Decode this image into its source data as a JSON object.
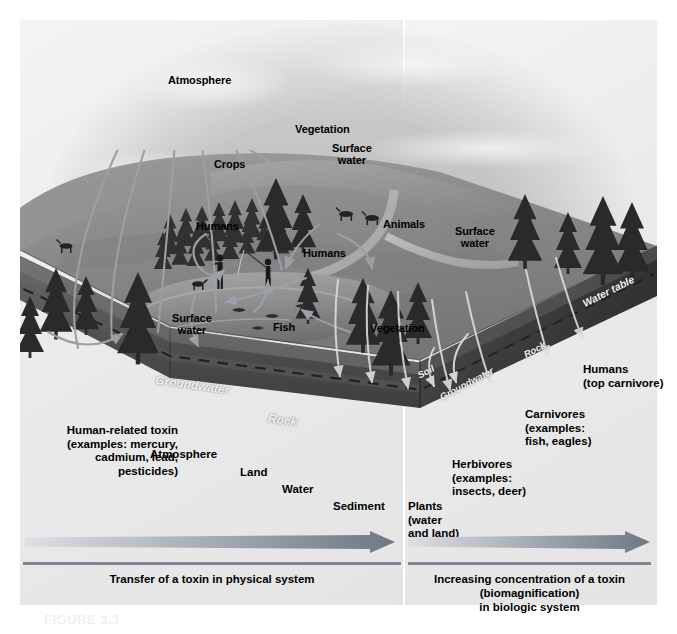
{
  "figure": {
    "number": "FIGURE 3.3"
  },
  "scene_labels": {
    "atmosphere": "Atmosphere",
    "vegetation_top": "Vegetation",
    "crops": "Crops",
    "humans_crops": "Humans",
    "surface_water_mid": "Surface\nwater",
    "animals": "Animals",
    "surface_water_right": "Surface\nwater",
    "humans_fishing": "Humans",
    "surface_water_lake": "Surface\nwater",
    "fish": "Fish",
    "vegetation_lake": "Vegetation",
    "groundwater_front": "Groundwater",
    "rock_front": "Rock",
    "water_table": "Water table",
    "soil_side": "Soil",
    "groundwater_side": "Groundwater",
    "rock_side": "Rock"
  },
  "physical_system": {
    "source_label": "Human-related toxin\n(examples: mercury,\ncadmium, lead,\npesticides)",
    "steps": [
      {
        "id": "atmosphere",
        "label": "Atmosphere"
      },
      {
        "id": "land",
        "label": "Land"
      },
      {
        "id": "water",
        "label": "Water"
      },
      {
        "id": "sediment",
        "label": "Sediment"
      }
    ],
    "caption": "Transfer of a toxin in physical system",
    "arrow": {
      "start_color": "#d9dde2",
      "end_color": "#6f7783"
    }
  },
  "biologic_system": {
    "steps": [
      {
        "id": "plants",
        "label": "Plants\n(water\nand land)"
      },
      {
        "id": "herbivores",
        "label": "Herbivores\n(examples:\ninsects, deer)"
      },
      {
        "id": "carnivores",
        "label": "Carnivores\n(examples:\nfish, eagles)"
      },
      {
        "id": "humans",
        "label": "Humans\n(top carnivore)"
      }
    ],
    "caption": "Increasing concentration of a toxin\n(biomagnification)\nin biologic system",
    "arrow": {
      "start_color": "#d9dde2",
      "end_color": "#6f7783"
    }
  },
  "palette": {
    "board": "#e9e9e9",
    "rule": "#7e8692",
    "flow_arrow": "#9aa0a8",
    "ink": "#000000"
  }
}
